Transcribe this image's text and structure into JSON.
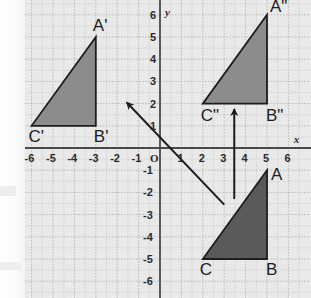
{
  "figure": {
    "background_color": "#e9e9e9",
    "grid_color": "#b9b9b9",
    "minor_grid_color": "#d2d2d2",
    "axis_color": "#4a4a4a",
    "x_axis_label": "x",
    "y_axis_label": "y",
    "origin_label": "O"
  },
  "chart_data": {
    "type": "scatter",
    "title": "",
    "xlabel": "x",
    "ylabel": "y",
    "xlim": [
      -6.6,
      6.6
    ],
    "ylim": [
      -6.6,
      6.6
    ],
    "grid": true,
    "minor_grid_step": 0.5,
    "major_grid_step": 1,
    "legend": "none",
    "x_ticks": [
      -6,
      -5,
      -4,
      -3,
      -2,
      -1,
      1,
      2,
      3,
      4,
      5,
      6
    ],
    "y_ticks": [
      6,
      5,
      4,
      3,
      2,
      1,
      -1,
      -2,
      -3,
      -4,
      -5,
      -6
    ],
    "x_tick_labels": [
      "-6",
      "-5",
      "-4",
      "-3",
      "-2",
      "-1",
      "1",
      "2",
      "3",
      "4",
      "5",
      "6"
    ],
    "y_tick_labels": [
      "6",
      "5",
      "4",
      "3",
      "2",
      "1",
      "-1",
      "-2",
      "-3",
      "-4",
      "-5",
      "-6"
    ],
    "shapes": [
      {
        "name": "triangle-abc",
        "label": "ABC",
        "fill": "#5a5a5a",
        "stroke": "#1d1d1d",
        "vertices": [
          {
            "label": "A",
            "x": 5,
            "y": -1
          },
          {
            "label": "B",
            "x": 5,
            "y": -5
          },
          {
            "label": "C",
            "x": 2,
            "y": -5
          }
        ]
      },
      {
        "name": "triangle-a2b2c2",
        "label": "A\"B\"C\"",
        "fill": "#8c8c8c",
        "stroke": "#1d1d1d",
        "vertices": [
          {
            "label": "A\"",
            "x": 5,
            "y": 6
          },
          {
            "label": "B\"",
            "x": 5,
            "y": 2
          },
          {
            "label": "C\"",
            "x": 2,
            "y": 2
          }
        ]
      },
      {
        "name": "triangle-a1b1c1",
        "label": "A'B'C'",
        "fill": "#8c8c8c",
        "stroke": "#1d1d1d",
        "vertices": [
          {
            "label": "A'",
            "x": -3,
            "y": 5
          },
          {
            "label": "B'",
            "x": -3,
            "y": 1
          },
          {
            "label": "C'",
            "x": -6,
            "y": 1
          }
        ]
      }
    ],
    "arrows": [
      {
        "name": "translation-arrow-vertical",
        "from": {
          "x": 3.47,
          "y": -2.3
        },
        "to": {
          "x": 3.47,
          "y": 1.75
        },
        "color": "#1d1d1d"
      },
      {
        "name": "translation-arrow-diagonal",
        "from": {
          "x": 3.0,
          "y": -2.55
        },
        "to": {
          "x": -1.55,
          "y": 2.05
        },
        "color": "#1d1d1d"
      }
    ]
  },
  "labels": {
    "a_prime": "A'",
    "b_prime": "B'",
    "c_prime": "C'",
    "a_double_prime": "A\"",
    "b_double_prime": "B\"",
    "c_double_prime": "C\"",
    "a": "A",
    "b": "B",
    "c": "C"
  },
  "x_axis": {
    "name": "x",
    "ticks": [
      {
        "value": -6,
        "text": "-6"
      },
      {
        "value": -5,
        "text": "-5"
      },
      {
        "value": -4,
        "text": "-4"
      },
      {
        "value": -3,
        "text": "-3"
      },
      {
        "value": -2,
        "text": "-2"
      },
      {
        "value": -1,
        "text": "-1"
      },
      {
        "value": 1,
        "text": "1"
      },
      {
        "value": 2,
        "text": "2"
      },
      {
        "value": 3,
        "text": "3"
      },
      {
        "value": 4,
        "text": "4"
      },
      {
        "value": 5,
        "text": "5"
      },
      {
        "value": 6,
        "text": "6"
      }
    ]
  },
  "y_axis": {
    "name": "y",
    "ticks": [
      {
        "value": 6,
        "text": "6"
      },
      {
        "value": 5,
        "text": "5"
      },
      {
        "value": 4,
        "text": "4"
      },
      {
        "value": 3,
        "text": "3"
      },
      {
        "value": 2,
        "text": "2"
      },
      {
        "value": 1,
        "text": "1"
      },
      {
        "value": -1,
        "text": "-1"
      },
      {
        "value": -2,
        "text": "-2"
      },
      {
        "value": -3,
        "text": "-3"
      },
      {
        "value": -4,
        "text": "-4"
      },
      {
        "value": -5,
        "text": "-5"
      },
      {
        "value": -6,
        "text": "-6"
      }
    ]
  }
}
